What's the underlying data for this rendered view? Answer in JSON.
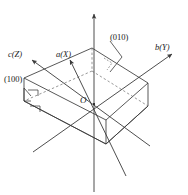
{
  "figure": {
    "type": "crystallographic-unit-cell-diagram",
    "background_color": "#ffffff",
    "line_color": "#3a3a3a",
    "dashed_line_color": "#6a6a6a",
    "text_color": "#1a1a1a"
  },
  "axes": [
    {
      "id": "a-axis",
      "label": "a(X)",
      "letter": "a",
      "crystal_axis": "a",
      "cartesian_axis": "X",
      "direction": "upper-left-front"
    },
    {
      "id": "b-axis",
      "label": "b(Y)",
      "letter": "b",
      "crystal_axis": "b",
      "cartesian_axis": "Y",
      "direction": "upper-right"
    },
    {
      "id": "c-axis",
      "label": "c(Z)",
      "letter": "c",
      "crystal_axis": "c",
      "cartesian_axis": "Z",
      "direction": "upper-left"
    },
    {
      "id": "vertical-axis",
      "label": "",
      "letter": "",
      "crystal_axis": "",
      "cartesian_axis": "",
      "direction": "vertical-up"
    }
  ],
  "origin": {
    "label": "O",
    "name": "origin"
  },
  "face_labels": [
    {
      "id": "face-100",
      "label": "(100)",
      "miller_index": "(100)",
      "position": "left"
    },
    {
      "id": "face-010",
      "label": "(010)",
      "miller_index": "(010)",
      "position": "upper-right"
    }
  ],
  "annotations": {
    "right_angle_marks": 4,
    "right_angle_mark_name": "right-angle-mark"
  }
}
